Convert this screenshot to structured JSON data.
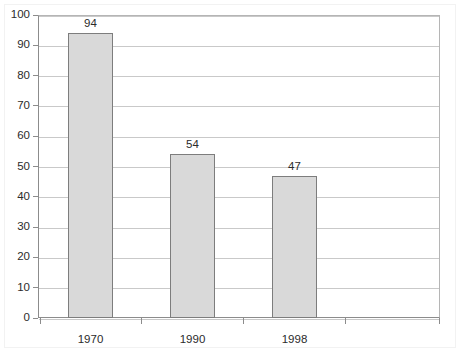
{
  "chart_data": {
    "type": "bar",
    "title": "",
    "subtitle": "",
    "xlabel": "",
    "ylabel": "",
    "categories": [
      "1970",
      "1990",
      "1998"
    ],
    "values": [
      94,
      54,
      47
    ],
    "data_labels": [
      "94",
      "54",
      "47"
    ],
    "ylim": [
      0,
      100
    ],
    "ytick_labels": [
      "0",
      "10",
      "20",
      "30",
      "40",
      "50",
      "60",
      "70",
      "80",
      "90",
      "100"
    ],
    "ytick_values": [
      0,
      10,
      20,
      30,
      40,
      50,
      60,
      70,
      80,
      90,
      100
    ],
    "grid": true,
    "legend": false,
    "legend_position": "none",
    "colors": {
      "bar_fill": "#d9d9d9",
      "bar_border": "#7d7d7d",
      "gridline": "#c9c9c9",
      "axis": "#8c8c8c",
      "text": "#2b2b2b",
      "background": "#ffffff"
    }
  }
}
